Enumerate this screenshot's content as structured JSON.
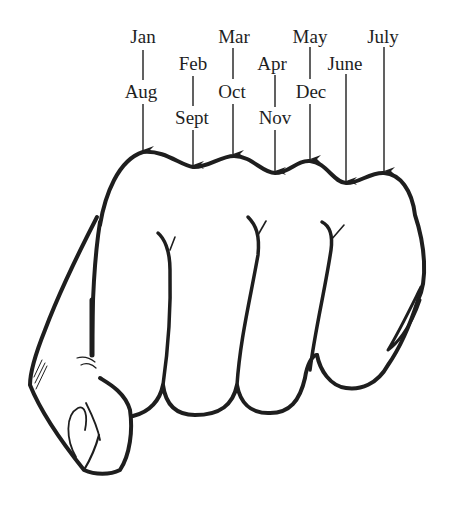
{
  "colors": {
    "ink": "#1e1e1e",
    "background": "#ffffff"
  },
  "labels": {
    "jan": "Jan",
    "aug": "Aug",
    "feb": "Feb",
    "sept": "Sept",
    "mar": "Mar",
    "oct": "Oct",
    "apr": "Apr",
    "nov": "Nov",
    "may": "May",
    "dec": "Dec",
    "june": "June",
    "july": "July"
  },
  "knuckles": [
    {
      "position": "knuckle",
      "months": [
        "Jan",
        "Aug"
      ]
    },
    {
      "position": "valley",
      "months": [
        "Feb",
        "Sept"
      ]
    },
    {
      "position": "knuckle",
      "months": [
        "Mar",
        "Oct"
      ]
    },
    {
      "position": "valley",
      "months": [
        "Apr",
        "Nov"
      ]
    },
    {
      "position": "knuckle",
      "months": [
        "May",
        "Dec"
      ]
    },
    {
      "position": "valley",
      "months": [
        "June"
      ]
    },
    {
      "position": "knuckle",
      "months": [
        "July"
      ]
    }
  ]
}
